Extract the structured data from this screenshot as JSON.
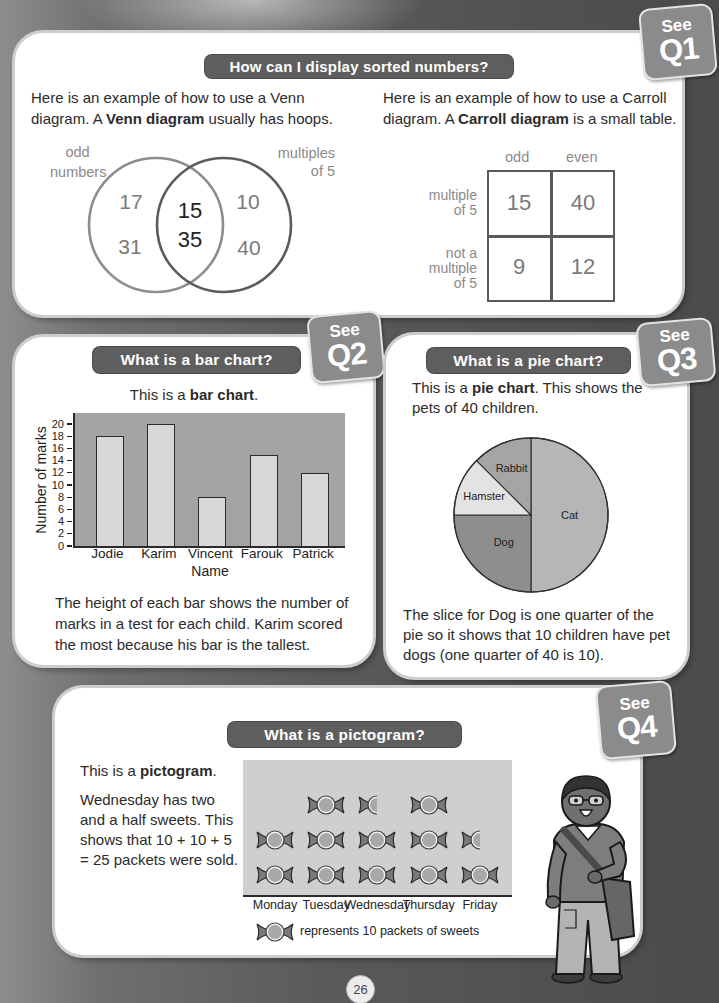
{
  "page": {
    "number": "26"
  },
  "colors": {
    "page_background": "#555555",
    "panel_background": "#ffffff",
    "title_pill": "#5e5e5e",
    "see_badge": "#8b8b8b",
    "venn_left_hoop": "#8d8d8d",
    "venn_right_hoop": "#5c5c5c",
    "bar_plot_background": "#a4a4a4",
    "bar_fill": "#d8d8d8",
    "pictogram_background": "#cfcfcf",
    "pie_slices": [
      "#b6b6b6",
      "#8e8e8e",
      "#e3e3e3",
      "#a5a5a5"
    ]
  },
  "sorted_numbers": {
    "title": "How can I display sorted numbers?",
    "badge": {
      "see": "See",
      "q": "Q1"
    },
    "venn_intro": {
      "line1": "Here is an example of how to use a Venn",
      "line2_before": "diagram. A ",
      "line2_bold": "Venn diagram",
      "line2_after": " usually has hoops."
    },
    "carroll_intro": {
      "line1": "Here is an example of how to use a Carroll",
      "line2_before": "diagram. A ",
      "line2_bold": "Carroll diagram",
      "line2_after": " is a small table."
    },
    "venn": {
      "left_label": [
        "odd",
        "numbers"
      ],
      "right_label": [
        "multiples",
        "of 5"
      ],
      "left_only": [
        "17",
        "31"
      ],
      "both": [
        "15",
        "35"
      ],
      "right_only": [
        "10",
        "40"
      ]
    },
    "carroll": {
      "col_headers": [
        "odd",
        "even"
      ],
      "rows": [
        {
          "label": [
            "multiple",
            "of 5"
          ],
          "cells": [
            "15",
            "40"
          ]
        },
        {
          "label": [
            "not a",
            "multiple",
            "of 5"
          ],
          "cells": [
            "9",
            "12"
          ]
        }
      ]
    }
  },
  "bar_section": {
    "title": "What is a bar chart?",
    "badge": {
      "see": "See",
      "q": "Q2"
    },
    "intro_before": "This is a ",
    "intro_bold": "bar chart",
    "intro_after": ".",
    "lines": [
      "The height of each bar shows the number of",
      "marks in a test for each child. Karim scored",
      "the most because his bar is the tallest."
    ]
  },
  "pie_section": {
    "title": "What is a pie chart?",
    "badge": {
      "see": "See",
      "q": "Q3"
    },
    "intro_line1_before": "This is a ",
    "intro_line1_bold": "pie chart",
    "intro_line1_after": ". This shows the",
    "intro_line2": "pets of 40 children.",
    "lines": [
      "The slice for Dog is one quarter of the",
      "pie so it shows that 10 children have pet",
      "dogs (one quarter of 40 is 10)."
    ]
  },
  "pictogram_section": {
    "title": "What is a pictogram?",
    "badge": {
      "see": "See",
      "q": "Q4"
    },
    "intro_before": "This is a ",
    "intro_bold": "pictogram",
    "intro_after": ".",
    "lines": [
      "Wednesday has two",
      "and a half sweets. This",
      "shows that 10 + 10 + 5",
      "= 25 packets were sold."
    ],
    "key_icon": "candy-icon",
    "key_text": "represents 10 packets of sweets"
  },
  "chart_data": [
    {
      "type": "bar",
      "title": "",
      "categories": [
        "Jodie",
        "Karim",
        "Vincent",
        "Farouk",
        "Patrick"
      ],
      "values": [
        18,
        20,
        8,
        15,
        12
      ],
      "xlabel": "Name",
      "ylabel": "Number of marks",
      "ylim": [
        0,
        20
      ],
      "yticks": [
        0,
        2,
        4,
        6,
        8,
        10,
        12,
        14,
        16,
        18,
        20
      ],
      "grid": false,
      "legend": null
    },
    {
      "type": "pie",
      "title": "",
      "labels": [
        "Cat",
        "Dog",
        "Hamster",
        "Rabbit"
      ],
      "values": [
        20,
        10,
        5,
        5
      ],
      "total": 40,
      "start": "12 o'clock, clockwise"
    },
    {
      "type": "pictogram",
      "title": "",
      "categories": [
        "Monday",
        "Tuesday",
        "Wednesday",
        "Thursday",
        "Friday"
      ],
      "symbols": [
        2,
        3,
        2.5,
        3,
        1.5
      ],
      "values": [
        20,
        30,
        25,
        30,
        15
      ],
      "key": {
        "symbol": "candy",
        "represents": 10,
        "text": "represents 10 packets of sweets"
      }
    }
  ]
}
